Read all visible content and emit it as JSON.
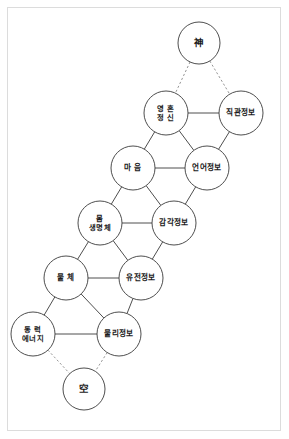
{
  "diagram": {
    "title": "",
    "type": "node-link-lattice",
    "width": 289,
    "height": 439,
    "background_color": "#ffffff",
    "frame_color": "#dcdcdc",
    "solid_edge_color": "#3a3a3a",
    "dashed_edge_color": "#8a8a8a",
    "node_fill": "#ffffff",
    "node_stroke": "#3a3a3a",
    "node_radius": 21,
    "nodes": [
      {
        "id": "sin",
        "lines": [
          "神"
        ],
        "cx": 199,
        "cy": 43,
        "r": 21,
        "script": "han"
      },
      {
        "id": "yeonghon",
        "lines": [
          "영 혼",
          "정 신"
        ],
        "cx": 166,
        "cy": 113,
        "r": 22,
        "script": "hangul"
      },
      {
        "id": "jikgwan",
        "lines": [
          "직관정보"
        ],
        "cx": 241,
        "cy": 113,
        "r": 22,
        "script": "hangul"
      },
      {
        "id": "maeum",
        "lines": [
          "마 음"
        ],
        "cx": 133,
        "cy": 168,
        "r": 22,
        "script": "hangul"
      },
      {
        "id": "eoneo",
        "lines": [
          "언어정보"
        ],
        "cx": 207,
        "cy": 168,
        "r": 22,
        "script": "hangul"
      },
      {
        "id": "mom",
        "lines": [
          "몸",
          "생명체"
        ],
        "cx": 100,
        "cy": 223,
        "r": 22,
        "script": "hangul"
      },
      {
        "id": "gamgak",
        "lines": [
          "감각정보"
        ],
        "cx": 174,
        "cy": 223,
        "r": 22,
        "script": "hangul"
      },
      {
        "id": "mulche",
        "lines": [
          "물 체"
        ],
        "cx": 66,
        "cy": 278,
        "r": 22,
        "script": "hangul"
      },
      {
        "id": "yujeon",
        "lines": [
          "유전정보"
        ],
        "cx": 141,
        "cy": 278,
        "r": 22,
        "script": "hangul"
      },
      {
        "id": "dongryeok",
        "lines": [
          "동 력",
          "에너지"
        ],
        "cx": 33,
        "cy": 334,
        "r": 22,
        "script": "hangul"
      },
      {
        "id": "mulli",
        "lines": [
          "물리정보"
        ],
        "cx": 119,
        "cy": 334,
        "r": 22,
        "script": "hangul"
      },
      {
        "id": "gong",
        "lines": [
          "空"
        ],
        "cx": 84,
        "cy": 389,
        "r": 21,
        "script": "han"
      }
    ],
    "edges": [
      {
        "from": "sin",
        "to": "yeonghon",
        "style": "dashed"
      },
      {
        "from": "sin",
        "to": "jikgwan",
        "style": "dashed"
      },
      {
        "from": "yeonghon",
        "to": "jikgwan",
        "style": "solid"
      },
      {
        "from": "yeonghon",
        "to": "maeum",
        "style": "solid"
      },
      {
        "from": "yeonghon",
        "to": "eoneo",
        "style": "solid"
      },
      {
        "from": "jikgwan",
        "to": "eoneo",
        "style": "solid"
      },
      {
        "from": "maeum",
        "to": "eoneo",
        "style": "solid"
      },
      {
        "from": "maeum",
        "to": "mom",
        "style": "solid"
      },
      {
        "from": "maeum",
        "to": "gamgak",
        "style": "solid"
      },
      {
        "from": "eoneo",
        "to": "gamgak",
        "style": "solid"
      },
      {
        "from": "mom",
        "to": "gamgak",
        "style": "solid"
      },
      {
        "from": "mom",
        "to": "mulche",
        "style": "solid"
      },
      {
        "from": "mom",
        "to": "yujeon",
        "style": "solid"
      },
      {
        "from": "gamgak",
        "to": "yujeon",
        "style": "solid"
      },
      {
        "from": "mulche",
        "to": "yujeon",
        "style": "solid"
      },
      {
        "from": "mulche",
        "to": "dongryeok",
        "style": "solid"
      },
      {
        "from": "mulche",
        "to": "mulli",
        "style": "solid"
      },
      {
        "from": "yujeon",
        "to": "mulli",
        "style": "solid"
      },
      {
        "from": "dongryeok",
        "to": "mulli",
        "style": "solid"
      },
      {
        "from": "dongryeok",
        "to": "gong",
        "style": "dashed"
      },
      {
        "from": "mulli",
        "to": "gong",
        "style": "dashed"
      }
    ]
  }
}
